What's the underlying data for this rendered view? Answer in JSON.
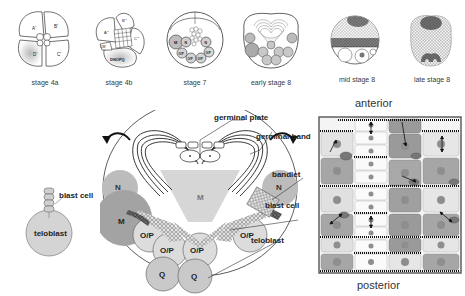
{
  "stages": [
    {
      "id": "4a",
      "label": "stage 4a",
      "cells": [
        "A'",
        "B'",
        "C'",
        "D'"
      ]
    },
    {
      "id": "4b",
      "label": "stage 4b",
      "cells": [
        "A'''",
        "B'''",
        "C'''",
        "CM'",
        "DNOPQ"
      ]
    },
    {
      "id": "7",
      "label": "stage 7",
      "cells": [
        "M",
        "N",
        "N",
        "O/P",
        "O/P",
        "O/P",
        "O/P"
      ]
    },
    {
      "id": "early8",
      "label": "early stage 8"
    },
    {
      "id": "mid8",
      "label": "mid stage 8"
    },
    {
      "id": "late8",
      "label": "late stage 8"
    }
  ],
  "teloblast_inset": {
    "blast_cell_label": "blast cell",
    "teloblast_label": "teloblast"
  },
  "main_diagram": {
    "callouts": {
      "germinal_plate": "germinal plate",
      "germinal_band": "germinal band",
      "bandlet": "bandlet",
      "blast_cell": "blast cell",
      "teloblast": "teloblast"
    },
    "cells": {
      "M_center": "M",
      "N_left": "N",
      "N_right": "N",
      "M_left": "M",
      "OP_1": "O/P",
      "OP_2": "O/P",
      "OP_3": "O/P",
      "OP_4": "O/P",
      "Q_left": "Q",
      "Q_right": "Q"
    }
  },
  "segment_panel": {
    "top_label": "anterior",
    "bottom_label": "posterior"
  },
  "colors": {
    "outline": "#2a2a2a",
    "light_gray": "#d9d9d9",
    "mid_gray": "#b3b3b3",
    "dark_gray": "#8c8c8c",
    "nucleus": "#9a9a9a",
    "panel_bg": "#f2f2f2"
  }
}
